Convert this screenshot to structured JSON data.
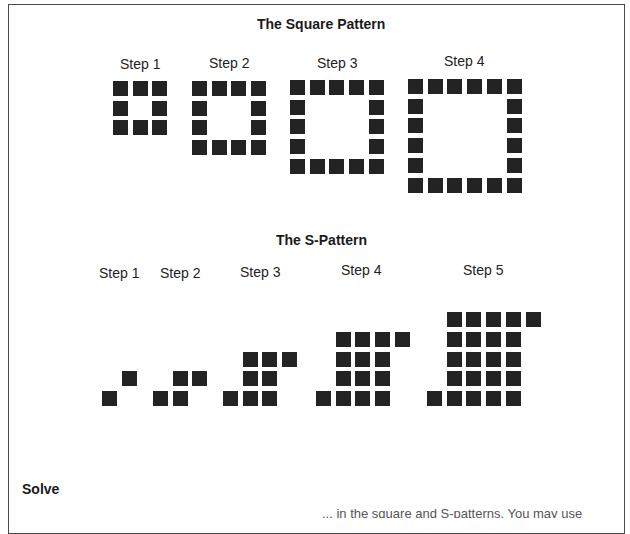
{
  "square_pattern": {
    "title": "The Square Pattern",
    "steps": [
      {
        "label": "Step 1",
        "side": 3
      },
      {
        "label": "Step 2",
        "side": 4
      },
      {
        "label": "Step 3",
        "side": 5
      },
      {
        "label": "Step 4",
        "side": 6
      }
    ]
  },
  "s_pattern": {
    "title": "The S-Pattern",
    "steps": [
      {
        "label": "Step 1"
      },
      {
        "label": "Step 2"
      },
      {
        "label": "Step 3"
      },
      {
        "label": "Step 4"
      },
      {
        "label": "Step 5"
      }
    ]
  },
  "solve": {
    "heading": "Solve",
    "partial_text": "... in the square and S-patterns. You may use"
  },
  "colors": {
    "tile": "#232323",
    "border": "#4a4a4a"
  }
}
